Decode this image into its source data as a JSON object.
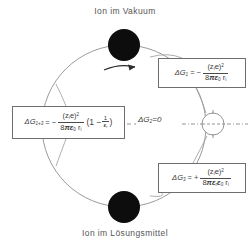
{
  "diagram": {
    "title_top": "Ion im Vakuum",
    "title_bottom": "Ion im Lösungsmittel",
    "type": "born-cycle-thermodynamic-diagram",
    "ink_color": "#4a4a4a",
    "background": "#ffffff"
  },
  "nodes": {
    "top_ion": {
      "name": "Ion im Vakuum",
      "fill": "#0d0d0d",
      "cx": 124,
      "cy": 45,
      "r": 16
    },
    "bottom_ion": {
      "name": "Ion im Lösungsmittel",
      "fill": "#0d0d0d",
      "cx": 124,
      "cy": 207,
      "r": 16
    },
    "right_circle": {
      "name": "leerer Kreis",
      "fill": "#ffffff",
      "cx": 213,
      "cy": 124,
      "r": 11
    }
  },
  "arrow": {
    "direction": "clockwise",
    "label": ""
  },
  "equations": {
    "dg1": {
      "lhs": "ΔG",
      "lhs_sub": "1",
      "op": "= −",
      "numerator": "(z",
      "numerator_sub": "i",
      "numerator_tail": "e)",
      "numerator_pow": "2",
      "den_prefix": "8",
      "den_pi": "π",
      "den_eps": "ε",
      "den_eps_sub": "0",
      "den_r": "r",
      "den_r_sub": "i",
      "plain": "ΔG1 = − (zi e)² / (8 π ε0 ri)"
    },
    "dg3": {
      "lhs": "ΔG",
      "lhs_sub": "3",
      "op": "= +",
      "numerator": "(z",
      "numerator_sub": "i",
      "numerator_tail": "e)",
      "numerator_pow": "2",
      "den_prefix": "8",
      "den_pi": "π",
      "den_eps1": "ε",
      "den_eps1_sub": "r",
      "den_eps2": "ε",
      "den_eps2_sub": "0",
      "den_r": "r",
      "den_r_sub": "i",
      "plain": "ΔG3 = + (zi e)² / (8 π εr ε0 ri)"
    },
    "dg13": {
      "lhs": "ΔG",
      "lhs_sub": "1+3",
      "op": "= −",
      "numerator": "(z",
      "numerator_sub": "i",
      "numerator_tail": "e)",
      "numerator_pow": "2",
      "den_prefix": "8",
      "den_pi": "π",
      "den_eps": "ε",
      "den_eps_sub": "0",
      "den_r": "r",
      "den_r_sub": "i",
      "paren_open": "(1 −",
      "paren_frac_num": "1",
      "paren_frac_den_eps": "ε",
      "paren_frac_den_sub": "r",
      "paren_close": ")",
      "plain": "ΔG1+3 = − (zi e)² / (8 π ε0 ri) · (1 − 1/εr)"
    },
    "dg2": {
      "text": "ΔG",
      "sub": "2",
      "value": "=0",
      "plain": "ΔG2 = 0"
    }
  }
}
